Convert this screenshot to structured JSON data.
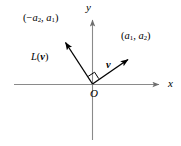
{
  "figure": {
    "name": "rotation-linear-map-diagram",
    "background_color": "#ffffff",
    "axis_color": "#8a8a8a",
    "vector_color": "#000000"
  },
  "axes": {
    "x_label": "x",
    "y_label": "y",
    "origin_label": "O",
    "x_axis": {
      "x1": 14,
      "y1": 84,
      "x2": 165,
      "y2": 84
    },
    "y_axis": {
      "x1": 92,
      "y1": 14,
      "x2": 92,
      "y2": 140
    }
  },
  "vectors": [
    {
      "name": "vector-v",
      "label": "v",
      "point_label_prefix": "(",
      "point_label": "(a1, a2)",
      "components": [
        "a",
        "1",
        "a",
        "2"
      ],
      "from": {
        "x": 92,
        "y": 84
      },
      "to": {
        "x": 133,
        "y": 56
      }
    },
    {
      "name": "vector-Lv",
      "label": "L(v)",
      "point_label": "(-a2, a1)",
      "components": [
        "a",
        "2",
        "a",
        "1"
      ],
      "from": {
        "x": 92,
        "y": 84
      },
      "to": {
        "x": 62,
        "y": 37
      }
    }
  ],
  "annotations": {
    "right_angle_marker": {
      "present": true,
      "x": 92,
      "y": 84,
      "size": 7
    }
  },
  "labels": {
    "point_lv_open": "(",
    "point_lv_minus": "−",
    "point_lv_a": "a",
    "point_lv_sub1": "2",
    "point_lv_comma": ", ",
    "point_lv_a2": "a",
    "point_lv_sub2": "1",
    "point_lv_close": ")",
    "point_v_open": "(",
    "point_v_a": "a",
    "point_v_sub1": "1",
    "point_v_comma": ", ",
    "point_v_a2": "a",
    "point_v_sub2": "2",
    "point_v_close": ")",
    "map_L": "L",
    "map_open": "(",
    "map_v": "v",
    "map_close": ")",
    "vec_v": "v",
    "axis_x": "x",
    "axis_y": "y",
    "origin": "O"
  }
}
